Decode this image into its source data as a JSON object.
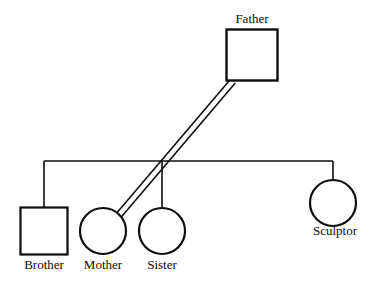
{
  "diagram": {
    "type": "genogram",
    "title": "",
    "background_color": "#ffffff",
    "line_color": "#0d0d0d",
    "shape_fill": "#ffffff",
    "nodes": [
      {
        "id": "father",
        "label": "Father",
        "shape": "square",
        "gender": "male",
        "cx": 252,
        "cy": 55,
        "size": 51,
        "label_x": 252,
        "label_y": 12,
        "stroke_width": 2.4
      },
      {
        "id": "brother",
        "label": "Brother",
        "shape": "square",
        "gender": "male",
        "cx": 44,
        "cy": 231,
        "size": 47,
        "label_x": 44,
        "label_y": 258,
        "stroke_width": 2.2
      },
      {
        "id": "mother",
        "label": "Mother",
        "shape": "circle",
        "gender": "female",
        "cx": 103,
        "cy": 231,
        "size": 46,
        "label_x": 103,
        "label_y": 258,
        "stroke_width": 2.2
      },
      {
        "id": "sister",
        "label": "Sister",
        "shape": "circle",
        "gender": "female",
        "cx": 162,
        "cy": 231,
        "size": 46,
        "label_x": 162,
        "label_y": 258,
        "stroke_width": 2.2
      },
      {
        "id": "sculptor",
        "label": "Sculptor",
        "shape": "circle",
        "gender": "female",
        "cx": 333,
        "cy": 203,
        "size": 46,
        "label_x": 335,
        "label_y": 224,
        "stroke_width": 2.2
      }
    ],
    "links": [
      {
        "id": "father-mother-relationship",
        "kind": "double-line",
        "from": "father",
        "to": "mother",
        "x1": 233,
        "y1": 81,
        "x2": 119,
        "y2": 215,
        "offset": 3.0,
        "stroke_width": 1.6
      },
      {
        "id": "sibling-bar",
        "kind": "sibling-line",
        "x1": 44,
        "y1": 161,
        "x2": 333,
        "y2": 161,
        "stroke_width": 1.6
      },
      {
        "id": "sibling-drop-brother",
        "kind": "drop-line",
        "to": "brother",
        "x": 44,
        "y1": 161,
        "y2": 208,
        "stroke_width": 1.6
      },
      {
        "id": "sibling-drop-sister",
        "kind": "drop-line",
        "to": "sister",
        "x": 162,
        "y1": 161,
        "y2": 208,
        "stroke_width": 1.6
      },
      {
        "id": "sibling-drop-sculptor",
        "kind": "drop-line",
        "to": "sculptor",
        "x": 333,
        "y1": 161,
        "y2": 180,
        "stroke_width": 1.6
      }
    ]
  }
}
